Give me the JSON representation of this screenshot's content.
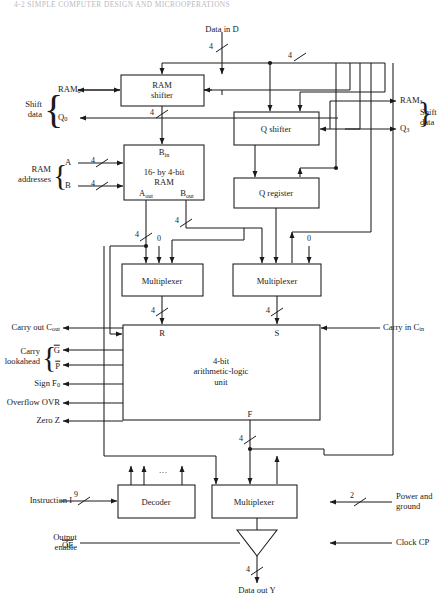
{
  "page": {
    "header": "4-2  SIMPLE COMPUTER DESIGN AND MICROOPERATIONS"
  },
  "diagram": {
    "blocks": {
      "ram_shifter": "RAM\nshifter",
      "ram_shifter_l1": "RAM",
      "ram_shifter_l2": "shifter",
      "ram_l1": "16- by 4-bit",
      "ram_l2": "RAM",
      "q_shifter": "Q shifter",
      "q_register": "Q register",
      "mux_left": "Multiplexer",
      "mux_right": "Multiplexer",
      "alu_l1": "4-bit",
      "alu_l2": "arithmetic-logic",
      "alu_l3": "unit",
      "decoder": "Decoder",
      "mux_bottom": "Multiplexer"
    },
    "ports": {
      "data_in": "Data in D",
      "data_out": "Data out Y",
      "ram0": "RAM",
      "ram0_sub": "0",
      "ram3": "RAM",
      "ram3_sub": "3",
      "q0": "Q",
      "q0_sub": "0",
      "q3": "Q",
      "q3_sub": "3",
      "shift_data_left_l1": "Shift",
      "shift_data_left_l2": "data",
      "shift_data_right_l1": "Shift",
      "shift_data_right_l2": "data",
      "ram_addr_l1": "RAM",
      "ram_addr_l2": "addresses",
      "addr_a": "A",
      "addr_b": "B",
      "b_in": "B",
      "b_in_sub": "in",
      "a_out": "A",
      "a_out_sub": "out",
      "b_out": "B",
      "b_out_sub": "out",
      "alu_r": "R",
      "alu_s": "S",
      "alu_f": "F",
      "carry_out": "Carry out C",
      "carry_out_sub": "out",
      "carry_in": "Carry in C",
      "carry_in_sub": "in",
      "lookahead_l1": "Carry",
      "lookahead_l2": "lookahead",
      "lookahead_g": "G",
      "lookahead_p": "P",
      "sign": "Sign F",
      "sign_sub": "0",
      "overflow": "Overflow OVR",
      "zero": "Zero Z",
      "instruction": "Instruction I",
      "output_enable_l1": "Output",
      "output_enable_l2": "enable",
      "output_enable_sig": "OE",
      "power_l1": "Power and",
      "power_l2": "ground",
      "clock": "Clock CP",
      "decoder_ellipsis": "···"
    },
    "bus_widths": {
      "data_in": "4",
      "ram_shifter_out": "4",
      "top_right": "4",
      "addr_a": "4",
      "addr_b": "4",
      "a_out": "4",
      "b_out": "4",
      "mux_left_out": "4",
      "mux_right_out": "4",
      "alu_f_out": "4",
      "data_out": "4",
      "instruction": "9",
      "power": "2"
    },
    "constants": {
      "zero_left": "0",
      "zero_right": "0"
    },
    "colors": {
      "line": "#1a1a1a",
      "background": "#ffffff",
      "box_fill": "#ffffff"
    }
  }
}
